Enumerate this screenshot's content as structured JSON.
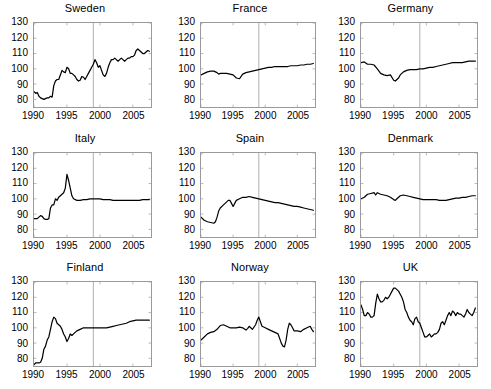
{
  "figure": {
    "title": "",
    "rows": 3,
    "cols": 3,
    "background": "#ffffff",
    "line_color": "#000000",
    "axis_color": "#9a9a9a",
    "refline_color": "#9a9a9a"
  },
  "axes": {
    "ytick_labels": [
      "130",
      "120",
      "110",
      "100",
      "90",
      "80"
    ],
    "ytick_values": [
      130,
      120,
      110,
      100,
      90,
      80
    ],
    "xtick_labels": [
      "1990",
      "1995",
      "2000",
      "2005"
    ],
    "xtick_values": [
      1990,
      1995,
      2000,
      2005
    ],
    "xlim": [
      1990,
      2007.75
    ],
    "ylim": [
      75,
      130
    ],
    "reference_line_x": 1999
  },
  "panels": [
    {
      "id": "sweden",
      "title": "Sweden",
      "row": 1,
      "col": 1
    },
    {
      "id": "france",
      "title": "France",
      "row": 1,
      "col": 2
    },
    {
      "id": "germany",
      "title": "Germany",
      "row": 1,
      "col": 3
    },
    {
      "id": "italy",
      "title": "Italy",
      "row": 2,
      "col": 1
    },
    {
      "id": "spain",
      "title": "Spain",
      "row": 2,
      "col": 2
    },
    {
      "id": "denmark",
      "title": "Denmark",
      "row": 2,
      "col": 3
    },
    {
      "id": "finland",
      "title": "Finland",
      "row": 3,
      "col": 1
    },
    {
      "id": "norway",
      "title": "Norway",
      "row": 3,
      "col": 2
    },
    {
      "id": "uk",
      "title": "UK",
      "row": 3,
      "col": 3
    }
  ],
  "chart_data": [
    {
      "type": "line",
      "title": "Sweden",
      "xlabel": "",
      "ylabel": "",
      "xlim": [
        1990,
        2007.75
      ],
      "ylim": [
        75,
        130
      ],
      "grid": false,
      "legend": "none",
      "annotations": [
        {
          "type": "vline",
          "x": 1999
        }
      ],
      "xtick_labels": [
        "1990",
        "1995",
        "2000",
        "2005"
      ],
      "ytick_labels": [
        "130",
        "120",
        "110",
        "100",
        "90",
        "80"
      ],
      "x": [
        1990.0,
        1990.25,
        1990.5,
        1990.75,
        1991.0,
        1991.25,
        1991.5,
        1991.75,
        1992.0,
        1992.25,
        1992.5,
        1992.75,
        1993.0,
        1993.25,
        1993.5,
        1993.75,
        1994.0,
        1994.25,
        1994.5,
        1994.75,
        1995.0,
        1995.25,
        1995.5,
        1995.75,
        1996.0,
        1996.25,
        1996.5,
        1996.75,
        1997.0,
        1997.25,
        1997.5,
        1997.75,
        1998.0,
        1998.25,
        1998.5,
        1998.75,
        1999.0,
        1999.25,
        1999.5,
        1999.75,
        2000.0,
        2000.25,
        2000.5,
        2000.75,
        2001.0,
        2001.25,
        2001.5,
        2001.75,
        2002.0,
        2002.25,
        2002.5,
        2002.75,
        2003.0,
        2003.25,
        2003.5,
        2003.75,
        2004.0,
        2004.25,
        2004.5,
        2004.75,
        2005.0,
        2005.25,
        2005.5,
        2005.75,
        2006.0,
        2006.25,
        2006.5,
        2006.75,
        2007.0,
        2007.25,
        2007.5
      ],
      "y": [
        85,
        84,
        84.5,
        82,
        81,
        80.5,
        80,
        80.5,
        81,
        81,
        82,
        81.5,
        89,
        92,
        93,
        93,
        96,
        99,
        98,
        97.5,
        101,
        100,
        97,
        97,
        96,
        95,
        93,
        92,
        92.5,
        95,
        94.5,
        93,
        95,
        97,
        99,
        101,
        103,
        106,
        104,
        101,
        102,
        99,
        96,
        95,
        97,
        101,
        104,
        106,
        106,
        107,
        106,
        105,
        106,
        107,
        106,
        105,
        106,
        107,
        107,
        108,
        108,
        109,
        112,
        113,
        112,
        111,
        110,
        110,
        111,
        112,
        111.5
      ]
    },
    {
      "type": "line",
      "title": "France",
      "xlabel": "",
      "ylabel": "",
      "xlim": [
        1990,
        2007.75
      ],
      "ylim": [
        75,
        130
      ],
      "grid": false,
      "legend": "none",
      "annotations": [
        {
          "type": "vline",
          "x": 1999
        }
      ],
      "xtick_labels": [
        "1990",
        "1995",
        "2000",
        "2005"
      ],
      "ytick_labels": [
        "130",
        "120",
        "110",
        "100",
        "90",
        "80"
      ],
      "x": [
        1990.0,
        1990.5,
        1991.0,
        1991.5,
        1992.0,
        1992.5,
        1992.75,
        1993.0,
        1993.5,
        1994.0,
        1994.5,
        1995.0,
        1995.5,
        1996.0,
        1996.25,
        1996.5,
        1997.0,
        1997.5,
        1998.0,
        1998.5,
        1999.0,
        1999.5,
        2000.0,
        2000.5,
        2001.0,
        2001.5,
        2002.0,
        2002.5,
        2003.0,
        2003.5,
        2004.0,
        2004.5,
        2005.0,
        2005.5,
        2006.0,
        2006.5,
        2007.0,
        2007.5
      ],
      "y": [
        96,
        97,
        98,
        98.5,
        98.5,
        97.5,
        96.5,
        97,
        97,
        97,
        96.5,
        96,
        94,
        93.5,
        95,
        96.5,
        97.5,
        98,
        98.5,
        99,
        99.5,
        100,
        100.5,
        101,
        101,
        101.5,
        101.5,
        101.5,
        101.5,
        101.5,
        102,
        102,
        102,
        102.5,
        102.5,
        103,
        103,
        103.5
      ]
    },
    {
      "type": "line",
      "title": "Germany",
      "xlabel": "",
      "ylabel": "",
      "xlim": [
        1990,
        2007.75
      ],
      "ylim": [
        75,
        130
      ],
      "grid": false,
      "legend": "none",
      "annotations": [
        {
          "type": "vline",
          "x": 1999
        }
      ],
      "xtick_labels": [
        "1990",
        "1995",
        "2000",
        "2005"
      ],
      "ytick_labels": [
        "130",
        "120",
        "110",
        "100",
        "90",
        "80"
      ],
      "x": [
        1990.0,
        1990.5,
        1991.0,
        1991.5,
        1992.0,
        1992.5,
        1993.0,
        1993.5,
        1994.0,
        1994.5,
        1995.0,
        1995.25,
        1995.5,
        1995.75,
        1996.0,
        1996.5,
        1997.0,
        1997.5,
        1998.0,
        1998.5,
        1999.0,
        1999.5,
        2000.0,
        2000.5,
        2001.0,
        2001.5,
        2002.0,
        2002.5,
        2003.0,
        2003.5,
        2004.0,
        2004.5,
        2005.0,
        2005.5,
        2006.0,
        2006.5,
        2007.0,
        2007.5
      ],
      "y": [
        104,
        104.5,
        103,
        103,
        102.5,
        100,
        97,
        96,
        95.5,
        96,
        92.5,
        92,
        93,
        94,
        96,
        98,
        99,
        99.5,
        99.5,
        99.5,
        100,
        100,
        100.5,
        101,
        101,
        101.5,
        102,
        102.5,
        103,
        103.5,
        104,
        104,
        104,
        104,
        104.5,
        105,
        105,
        105
      ]
    },
    {
      "type": "line",
      "title": "Italy",
      "xlabel": "",
      "ylabel": "",
      "xlim": [
        1990,
        2007.75
      ],
      "ylim": [
        75,
        130
      ],
      "grid": false,
      "legend": "none",
      "annotations": [
        {
          "type": "vline",
          "x": 1999
        }
      ],
      "xtick_labels": [
        "1990",
        "1995",
        "2000",
        "2005"
      ],
      "ytick_labels": [
        "130",
        "120",
        "110",
        "100",
        "90",
        "80"
      ],
      "x": [
        1990.0,
        1990.5,
        1991.0,
        1991.25,
        1991.5,
        1991.75,
        1992.0,
        1992.25,
        1992.5,
        1992.75,
        1993.0,
        1993.25,
        1993.5,
        1993.75,
        1994.0,
        1994.25,
        1994.5,
        1994.75,
        1995.0,
        1995.25,
        1995.5,
        1995.75,
        1996.0,
        1996.5,
        1997.0,
        1997.5,
        1998.0,
        1998.5,
        1999.0,
        1999.5,
        2000.0,
        2000.5,
        2001.0,
        2001.5,
        2002.0,
        2002.5,
        2003.0,
        2003.5,
        2004.0,
        2004.5,
        2005.0,
        2005.5,
        2006.0,
        2006.5,
        2007.0,
        2007.5
      ],
      "y": [
        87,
        87,
        89,
        88.5,
        87,
        86.5,
        86.5,
        87,
        94,
        96,
        96,
        100,
        99,
        101,
        102,
        103,
        104,
        107,
        116,
        112,
        107,
        102,
        100,
        99,
        99,
        99.5,
        99.5,
        100,
        100,
        100,
        100,
        99.5,
        99.5,
        99.5,
        99,
        99,
        99,
        99,
        99,
        99,
        99,
        99,
        99,
        99.5,
        99.5,
        99.5
      ]
    },
    {
      "type": "line",
      "title": "Spain",
      "xlabel": "",
      "ylabel": "",
      "xlim": [
        1990,
        2007.75
      ],
      "ylim": [
        75,
        130
      ],
      "grid": false,
      "legend": "none",
      "annotations": [
        {
          "type": "vline",
          "x": 1999
        }
      ],
      "xtick_labels": [
        "1990",
        "1995",
        "2000",
        "2005"
      ],
      "ytick_labels": [
        "130",
        "120",
        "110",
        "100",
        "90",
        "80"
      ],
      "x": [
        1990.0,
        1990.5,
        1991.0,
        1991.5,
        1992.0,
        1992.25,
        1992.5,
        1992.75,
        1993.0,
        1993.5,
        1994.0,
        1994.25,
        1994.5,
        1994.75,
        1995.0,
        1995.25,
        1995.5,
        1996.0,
        1996.5,
        1997.0,
        1997.5,
        1998.0,
        1998.5,
        1999.0,
        1999.5,
        2000.0,
        2000.5,
        2001.0,
        2001.5,
        2002.0,
        2002.5,
        2003.0,
        2003.5,
        2004.0,
        2004.5,
        2005.0,
        2005.5,
        2006.0,
        2006.5,
        2007.0,
        2007.5
      ],
      "y": [
        88,
        86,
        85,
        84.5,
        84,
        85,
        88,
        92,
        94,
        96,
        98,
        99,
        99,
        97,
        95,
        97,
        99,
        100,
        101,
        101,
        101.5,
        101,
        100.5,
        100,
        99.5,
        99,
        98.5,
        98,
        97.5,
        97.5,
        97,
        96.5,
        96,
        95.5,
        95,
        95,
        94.5,
        94,
        93.5,
        93,
        92.5
      ]
    },
    {
      "type": "line",
      "title": "Denmark",
      "xlabel": "",
      "ylabel": "",
      "xlim": [
        1990,
        2007.75
      ],
      "ylim": [
        75,
        130
      ],
      "grid": false,
      "legend": "none",
      "annotations": [
        {
          "type": "vline",
          "x": 1999
        }
      ],
      "xtick_labels": [
        "1990",
        "1995",
        "2000",
        "2005"
      ],
      "ytick_labels": [
        "130",
        "120",
        "110",
        "100",
        "90",
        "80"
      ],
      "x": [
        1990.0,
        1990.5,
        1991.0,
        1991.5,
        1992.0,
        1992.25,
        1992.5,
        1992.75,
        1993.0,
        1993.5,
        1994.0,
        1994.5,
        1995.0,
        1995.25,
        1995.5,
        1995.75,
        1996.0,
        1996.5,
        1997.0,
        1997.5,
        1998.0,
        1998.5,
        1999.0,
        1999.5,
        2000.0,
        2000.5,
        2001.0,
        2001.5,
        2002.0,
        2002.5,
        2003.0,
        2003.5,
        2004.0,
        2004.5,
        2005.0,
        2005.5,
        2006.0,
        2006.5,
        2007.0,
        2007.5
      ],
      "y": [
        100,
        101,
        103,
        103.5,
        104,
        102.5,
        104,
        103.5,
        103,
        102.5,
        102,
        101,
        99.5,
        99,
        100,
        101,
        102,
        102.5,
        102,
        101.5,
        101,
        100.5,
        100,
        99.5,
        99.5,
        99.5,
        99.5,
        99.5,
        99,
        99,
        99,
        99.5,
        100,
        100.5,
        100.5,
        101,
        101,
        101.5,
        102,
        102
      ]
    },
    {
      "type": "line",
      "title": "Finland",
      "xlabel": "",
      "ylabel": "",
      "xlim": [
        1990,
        2007.75
      ],
      "ylim": [
        75,
        130
      ],
      "grid": false,
      "legend": "none",
      "annotations": [
        {
          "type": "vline",
          "x": 1999
        }
      ],
      "xtick_labels": [
        "1990",
        "1995",
        "2000",
        "2005"
      ],
      "ytick_labels": [
        "130",
        "120",
        "110",
        "100",
        "90",
        "80"
      ],
      "x": [
        1990.0,
        1990.25,
        1990.5,
        1990.75,
        1991.0,
        1991.25,
        1991.5,
        1991.75,
        1992.0,
        1992.25,
        1992.5,
        1992.75,
        1993.0,
        1993.25,
        1993.5,
        1993.75,
        1994.0,
        1994.25,
        1994.5,
        1994.75,
        1995.0,
        1995.25,
        1995.5,
        1995.75,
        1996.0,
        1996.5,
        1997.0,
        1997.5,
        1998.0,
        1998.5,
        1999.0,
        1999.5,
        2000.0,
        2000.5,
        2001.0,
        2001.5,
        2002.0,
        2002.5,
        2003.0,
        2003.5,
        2004.0,
        2004.5,
        2005.0,
        2005.5,
        2006.0,
        2006.5,
        2007.0,
        2007.5
      ],
      "y": [
        76,
        77,
        77,
        77,
        77.5,
        80,
        86,
        88,
        92,
        94,
        99,
        104,
        107,
        106,
        103,
        102,
        101,
        99,
        96,
        94,
        91,
        93,
        96,
        95,
        96,
        98,
        99,
        100,
        100,
        100,
        100,
        100,
        100,
        100,
        100,
        100.5,
        101,
        101.5,
        102,
        102.5,
        103,
        104,
        104.5,
        105,
        105,
        105,
        105,
        105
      ]
    },
    {
      "type": "line",
      "title": "Norway",
      "xlabel": "",
      "ylabel": "",
      "xlim": [
        1990,
        2007.75
      ],
      "ylim": [
        75,
        130
      ],
      "grid": false,
      "legend": "none",
      "annotations": [
        {
          "type": "vline",
          "x": 1999
        }
      ],
      "xtick_labels": [
        "1990",
        "1995",
        "2000",
        "2005"
      ],
      "ytick_labels": [
        "130",
        "120",
        "110",
        "100",
        "90",
        "80"
      ],
      "x": [
        1990.0,
        1990.5,
        1991.0,
        1991.5,
        1992.0,
        1992.5,
        1993.0,
        1993.5,
        1994.0,
        1994.5,
        1995.0,
        1995.5,
        1996.0,
        1996.5,
        1997.0,
        1997.25,
        1997.5,
        1997.75,
        1998.0,
        1998.5,
        1998.75,
        1999.0,
        1999.25,
        1999.5,
        2000.0,
        2000.5,
        2001.0,
        2001.5,
        2002.0,
        2002.25,
        2002.5,
        2002.75,
        2003.0,
        2003.25,
        2003.5,
        2003.75,
        2004.0,
        2004.25,
        2004.5,
        2005.0,
        2005.5,
        2006.0,
        2006.5,
        2007.0,
        2007.25,
        2007.5
      ],
      "y": [
        92,
        94,
        96,
        97,
        97.5,
        99,
        101.5,
        102,
        101,
        100,
        100,
        100,
        100.5,
        100,
        98.5,
        99.5,
        101,
        100,
        99,
        102,
        105,
        107,
        104,
        101,
        100,
        99,
        98,
        97,
        96,
        93,
        90,
        88,
        87.5,
        92,
        99,
        103,
        102,
        100,
        98,
        98,
        97.5,
        99,
        100,
        101,
        99,
        97.5
      ]
    },
    {
      "type": "line",
      "title": "UK",
      "xlabel": "",
      "ylabel": "",
      "xlim": [
        1990,
        2007.75
      ],
      "ylim": [
        75,
        130
      ],
      "grid": false,
      "legend": "none",
      "annotations": [
        {
          "type": "vline",
          "x": 1999
        }
      ],
      "xtick_labels": [
        "1990",
        "1995",
        "2000",
        "2005"
      ],
      "ytick_labels": [
        "130",
        "120",
        "110",
        "100",
        "90",
        "80"
      ],
      "x": [
        1990.0,
        1990.25,
        1990.5,
        1990.75,
        1991.0,
        1991.25,
        1991.5,
        1991.75,
        1992.0,
        1992.25,
        1992.5,
        1992.75,
        1993.0,
        1993.25,
        1993.5,
        1993.75,
        1994.0,
        1994.25,
        1994.5,
        1994.75,
        1995.0,
        1995.25,
        1995.5,
        1995.75,
        1996.0,
        1996.25,
        1996.5,
        1996.75,
        1997.0,
        1997.25,
        1997.5,
        1997.75,
        1998.0,
        1998.25,
        1998.5,
        1998.75,
        1999.0,
        1999.25,
        1999.5,
        1999.75,
        2000.0,
        2000.25,
        2000.5,
        2000.75,
        2001.0,
        2001.25,
        2001.5,
        2001.75,
        2002.0,
        2002.25,
        2002.5,
        2002.75,
        2003.0,
        2003.25,
        2003.5,
        2003.75,
        2004.0,
        2004.25,
        2004.5,
        2004.75,
        2005.0,
        2005.25,
        2005.5,
        2005.75,
        2006.0,
        2006.25,
        2006.5,
        2006.75,
        2007.0,
        2007.25,
        2007.5
      ],
      "y": [
        115,
        112,
        108,
        108,
        110,
        109,
        107,
        107,
        108,
        116,
        122,
        119,
        117,
        117,
        118,
        120,
        119,
        120,
        122,
        124,
        126,
        126,
        125,
        124,
        122,
        120,
        117,
        112,
        110,
        107,
        105,
        104,
        102,
        106,
        107,
        104,
        103,
        100,
        97,
        94,
        94,
        95,
        96,
        94,
        95,
        96,
        96,
        97,
        99,
        103,
        104,
        102,
        105,
        108,
        110,
        108,
        111,
        110,
        108,
        110,
        109,
        109,
        108,
        107,
        109,
        112,
        110,
        109,
        108,
        110,
        113
      ]
    }
  ]
}
